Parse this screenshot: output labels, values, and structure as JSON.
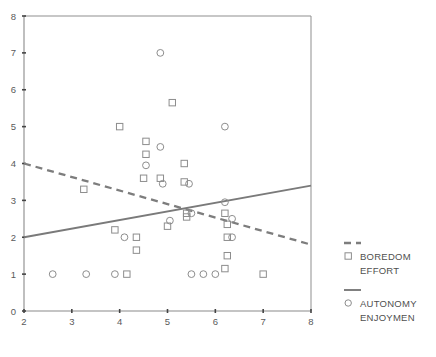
{
  "chart_data": {
    "type": "scatter",
    "title": "",
    "subtitle": "",
    "xlabel": "",
    "ylabel": "",
    "xlim": [
      2,
      8
    ],
    "ylim": [
      0,
      8
    ],
    "xticks": [
      "2",
      "3",
      "4",
      "5",
      "6",
      "7",
      "8"
    ],
    "yticks": [
      "0",
      "1",
      "2",
      "3",
      "4",
      "5",
      "6",
      "7",
      "8"
    ],
    "grid": false,
    "legend_position": "right",
    "series": [
      {
        "name": "BOREDOM EFFORT",
        "marker": "square",
        "line_style": "dashed",
        "color": "#7d7d7d",
        "points": [
          [
            3.25,
            3.3
          ],
          [
            4.0,
            5.0
          ],
          [
            4.55,
            4.6
          ],
          [
            4.55,
            4.25
          ],
          [
            4.5,
            3.6
          ],
          [
            4.85,
            3.6
          ],
          [
            5.1,
            5.65
          ],
          [
            5.35,
            4.0
          ],
          [
            5.35,
            3.5
          ],
          [
            5.4,
            2.65
          ],
          [
            5.4,
            2.55
          ],
          [
            4.35,
            2.0
          ],
          [
            4.35,
            1.65
          ],
          [
            4.15,
            1.0
          ],
          [
            5.0,
            2.3
          ],
          [
            6.2,
            2.65
          ],
          [
            6.25,
            2.35
          ],
          [
            6.25,
            2.0
          ],
          [
            6.25,
            1.5
          ],
          [
            6.2,
            1.15
          ],
          [
            7.0,
            1.0
          ],
          [
            3.9,
            2.2
          ]
        ]
      },
      {
        "name": "AUTONOMY ENJOYMEN",
        "marker": "circle",
        "line_style": "solid",
        "color": "#7a7a7a",
        "points": [
          [
            4.85,
            7.0
          ],
          [
            6.2,
            5.0
          ],
          [
            4.85,
            4.45
          ],
          [
            4.55,
            3.95
          ],
          [
            4.9,
            3.45
          ],
          [
            5.45,
            3.45
          ],
          [
            6.2,
            2.95
          ],
          [
            5.5,
            2.65
          ],
          [
            6.35,
            2.5
          ],
          [
            4.1,
            2.0
          ],
          [
            6.35,
            2.0
          ],
          [
            2.6,
            1.0
          ],
          [
            3.3,
            1.0
          ],
          [
            3.9,
            1.0
          ],
          [
            5.5,
            1.0
          ],
          [
            5.75,
            1.0
          ],
          [
            6.0,
            1.0
          ],
          [
            5.05,
            2.45
          ]
        ]
      }
    ],
    "trend_lines": [
      {
        "series": "BOREDOM EFFORT",
        "style": "dashed",
        "x_start": 2.0,
        "y_start": 4.0,
        "x_end": 8.0,
        "y_end": 1.8
      },
      {
        "series": "AUTONOMY ENJOYMEN",
        "style": "solid",
        "x_start": 2.0,
        "y_start": 2.0,
        "x_end": 8.0,
        "y_end": 3.4
      }
    ]
  },
  "legend": {
    "entries": [
      {
        "marker": "square",
        "line_style": "dashed",
        "label_line1": "BOREDOM",
        "label_line2": "EFFORT"
      },
      {
        "marker": "circle",
        "line_style": "solid",
        "label_line1": "AUTONOMY",
        "label_line2": "ENJOYMEN"
      }
    ]
  }
}
